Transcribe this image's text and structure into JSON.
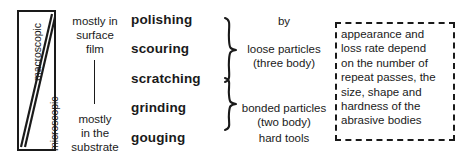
{
  "figure": {
    "scale_axis": {
      "top_label": "macroscopic",
      "bottom_label": "microscopic"
    },
    "depth_column": {
      "top": "mostly in\nsurface\nfilm",
      "bottom": "mostly\nin the\nsubstrate"
    },
    "wear_terms": [
      {
        "label": "polishing"
      },
      {
        "label": "scouring"
      },
      {
        "label": "scratching"
      },
      {
        "label": "grinding"
      },
      {
        "label": "gouging"
      }
    ],
    "agents": {
      "by": "by",
      "loose": "loose particles\n(three body)",
      "bonded": "bonded particles\n(two body)",
      "hard": "hard tools"
    },
    "note": "appearance and\nloss rate depend\non the number of\nrepeat passes, the\nsize, shape and\nhardness of the\nabrasive bodies"
  },
  "colors": {
    "ink": "#1a1a1a",
    "paper": "#ffffff"
  }
}
